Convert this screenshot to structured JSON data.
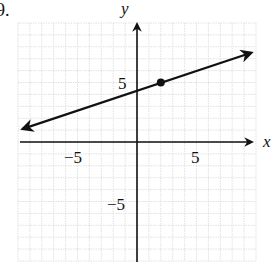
{
  "problem_number": "9.",
  "chart_data": {
    "type": "line",
    "title": "",
    "xlabel": "x",
    "ylabel": "y",
    "xlim": [
      -10,
      10
    ],
    "ylim": [
      -10,
      10
    ],
    "grid": true,
    "x_tick_labels": [
      "-5",
      "5"
    ],
    "y_tick_labels": [
      "5",
      "-5"
    ],
    "x_ticks": [
      -5,
      5
    ],
    "y_ticks": [
      5,
      -5
    ],
    "series": [
      {
        "name": "line",
        "equation": "y = (1/3)x + 13/3",
        "slope": 0.333,
        "y_intercept": 4.33,
        "x": [
          -9.6,
          9.6
        ],
        "y": [
          1.1,
          7.5
        ],
        "arrows_both_ends": true
      }
    ],
    "points": [
      {
        "x": 2,
        "y": 5,
        "style": "filled-dot"
      }
    ]
  },
  "labels": {
    "x_axis": "x",
    "y_axis": "y",
    "x_neg5": "−5",
    "x_pos5": "5",
    "y_pos5": "5",
    "y_neg5": "−5"
  }
}
